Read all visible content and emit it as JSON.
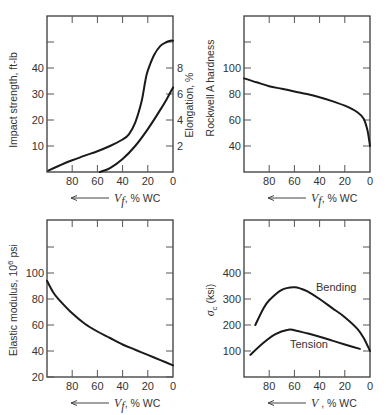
{
  "chart_data": [
    {
      "type": "line",
      "title": "",
      "xlabel": "V_f, % WC",
      "ylabel": "Impact strength, ft-lb",
      "ylabel_right": "Elongation, %",
      "x_direction": "reversed",
      "xlim": [
        100,
        0
      ],
      "ylim": [
        0,
        50
      ],
      "ylim_right": [
        0,
        10
      ],
      "xticks": [
        80,
        60,
        40,
        20,
        0
      ],
      "yticks": [
        10,
        20,
        30,
        40
      ],
      "yticks_right": [
        2,
        4,
        6,
        8
      ],
      "grid": false,
      "series": [
        {
          "name": "Impact strength",
          "axis": "left",
          "x": [
            99,
            90,
            80,
            70,
            60,
            50,
            40,
            35,
            30,
            25,
            22,
            20,
            15,
            10,
            5,
            2,
            0
          ],
          "y": [
            0.5,
            2.5,
            4.5,
            6.3,
            8,
            10,
            12.5,
            14.5,
            19,
            27,
            35,
            39,
            45,
            48.5,
            50,
            50.5,
            50.5
          ]
        },
        {
          "name": "Elongation",
          "axis": "right",
          "x": [
            58,
            50,
            40,
            30,
            20,
            10,
            5,
            0
          ],
          "y": [
            0,
            0.3,
            1.0,
            2.0,
            3.3,
            4.8,
            5.6,
            6.5
          ]
        }
      ]
    },
    {
      "type": "line",
      "title": "",
      "xlabel": "V_f, % WC",
      "ylabel": "Rockwell A hardness",
      "x_direction": "reversed",
      "xlim": [
        100,
        0
      ],
      "ylim": [
        20,
        140
      ],
      "xticks": [
        80,
        60,
        40,
        20,
        0
      ],
      "yticks": [
        40,
        60,
        80,
        100
      ],
      "grid": false,
      "series": [
        {
          "name": "Hardness",
          "x": [
            100,
            90,
            80,
            70,
            60,
            50,
            40,
            30,
            20,
            10,
            5,
            2,
            0
          ],
          "y": [
            92,
            89,
            86,
            84,
            82,
            80,
            77.5,
            74.5,
            71,
            66,
            61,
            52,
            40
          ]
        }
      ]
    },
    {
      "type": "line",
      "title": "",
      "xlabel": "V_f, % WC",
      "ylabel": "Elastic modulus, 10^6 psi",
      "x_direction": "reversed",
      "xlim": [
        100,
        0
      ],
      "ylim": [
        20,
        140
      ],
      "xticks": [
        80,
        60,
        40,
        20,
        0
      ],
      "yticks": [
        20,
        40,
        60,
        80,
        100
      ],
      "grid": false,
      "series": [
        {
          "name": "Elastic modulus",
          "x": [
            100,
            95,
            90,
            80,
            70,
            60,
            50,
            40,
            30,
            20,
            10,
            0
          ],
          "y": [
            94,
            85,
            79,
            69,
            61,
            55,
            50,
            45,
            41,
            37,
            33,
            29
          ]
        }
      ]
    },
    {
      "type": "line",
      "title": "",
      "xlabel": "V , % WC",
      "ylabel": "σ_c (ksi)",
      "x_direction": "reversed",
      "xlim": [
        100,
        0
      ],
      "ylim": [
        0,
        600
      ],
      "xticks": [
        80,
        60,
        40,
        20,
        0
      ],
      "yticks": [
        100,
        200,
        300,
        400
      ],
      "grid": false,
      "series": [
        {
          "name": "Bending",
          "x": [
            91,
            85,
            80,
            70,
            60,
            55,
            50,
            40,
            30,
            20,
            10,
            5,
            0
          ],
          "y": [
            200,
            260,
            295,
            335,
            345,
            340,
            330,
            300,
            265,
            230,
            185,
            150,
            100
          ]
        },
        {
          "name": "Tension",
          "x": [
            95,
            85,
            75,
            65,
            60,
            50,
            40,
            30,
            20,
            8
          ],
          "y": [
            85,
            130,
            165,
            182,
            180,
            168,
            155,
            140,
            125,
            108
          ]
        }
      ]
    }
  ],
  "labels": {
    "p1": {
      "ylabel": "Impact strength, ft-lb",
      "ylabel_right": "Elongation, %",
      "xvar": "V",
      "xsub": "f",
      "xunit": ", % WC"
    },
    "p2": {
      "ylabel": "Rockwell A hardness",
      "xvar": "V",
      "xsub": "f",
      "xunit": ", % WC"
    },
    "p3": {
      "ylabel_pre": "Elastic modulus, 10",
      "ylabel_sup": "6",
      "ylabel_post": " psi",
      "xvar": "V",
      "xsub": "f",
      "xunit": ", % WC"
    },
    "p4": {
      "ylabel_sym": "σ",
      "ylabel_sub": "c",
      "ylabel_post": " (ksi)",
      "xvar": "V",
      "xsub": "",
      "xunit": " , % WC",
      "annot_bending": "Bending",
      "annot_tension": "Tension"
    }
  }
}
